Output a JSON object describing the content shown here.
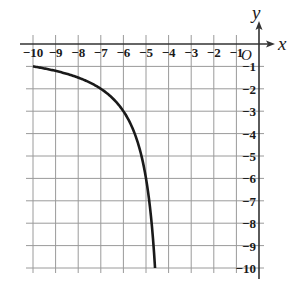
{
  "chart_data": {
    "type": "line",
    "title": "",
    "function": "y = 6/(x+4)",
    "xlabel": "x",
    "ylabel": "y",
    "origin_label": "O",
    "xlim": [
      -10,
      0
    ],
    "ylim": [
      -10,
      0
    ],
    "grid": true,
    "x_ticks": [
      -10,
      -9,
      -8,
      -7,
      -6,
      -5,
      -4,
      -3,
      -2,
      -1
    ],
    "x_tick_labels": [
      "−10",
      "−9",
      "−8",
      "−7",
      "−6",
      "−5",
      "−4",
      "−3",
      "−2",
      "−1"
    ],
    "y_ticks": [
      -1,
      -2,
      -3,
      -4,
      -5,
      -6,
      -7,
      -8,
      -9,
      -10
    ],
    "y_tick_labels": [
      "−1",
      "−2",
      "−3",
      "−4",
      "−5",
      "−6",
      "−7",
      "−8",
      "−9",
      "−10"
    ],
    "series": [
      {
        "name": "curve",
        "x": [
          -10,
          -9,
          -8,
          -7,
          -6,
          -5.5,
          -5,
          -4.75,
          -4.6
        ],
        "y": [
          -1,
          -1.2,
          -1.5,
          -2,
          -3,
          -4,
          -6,
          -8,
          -10
        ]
      }
    ],
    "colors": {
      "curve": "#1a1a1a",
      "grid": "#9a9a9a",
      "axis": "#333333"
    }
  }
}
